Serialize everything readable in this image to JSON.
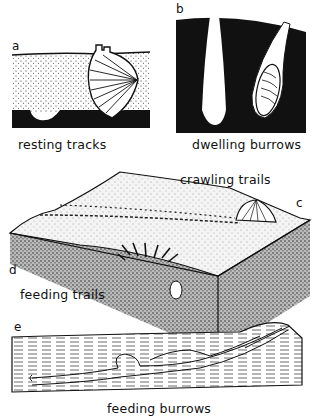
{
  "panels": {
    "a": {
      "letter": "a",
      "caption": "resting tracks"
    },
    "b": {
      "letter": "b",
      "caption": "dwelling burrows"
    },
    "c": {
      "letter": "c",
      "caption": "crawling trails"
    },
    "d": {
      "letter": "d",
      "caption": "feeding trails"
    },
    "e": {
      "letter": "e",
      "caption": "feeding burrows"
    }
  },
  "colors": {
    "ink": "#111111",
    "paper": "#ffffff",
    "sand": "#e6e6e6"
  }
}
